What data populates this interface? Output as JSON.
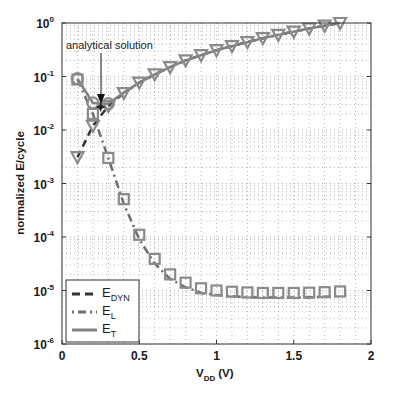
{
  "chart_data": {
    "type": "line",
    "title": "",
    "xlabel": "V_DD (V)",
    "xlabel_main": "V",
    "xlabel_sub": "DD",
    "xlabel_unit": "(V)",
    "ylabel": "normalized E/cycle",
    "xlim": [
      0,
      2
    ],
    "ylim": [
      1e-06,
      1
    ],
    "yscale": "log",
    "grid": true,
    "x_ticks": [
      "0",
      "0.5",
      "1",
      "1.5",
      "2"
    ],
    "x_tick_values": [
      0,
      0.5,
      1,
      1.5,
      2
    ],
    "y_ticks": [
      "10^0",
      "10^-1",
      "10^-2",
      "10^-3",
      "10^-4",
      "10^-5",
      "10^-6"
    ],
    "y_tick_exponents": [
      "0",
      "-1",
      "-2",
      "-3",
      "-4",
      "-5",
      "-6"
    ],
    "legend_position": "lower left",
    "x": [
      0.1,
      0.2,
      0.3,
      0.4,
      0.5,
      0.6,
      0.7,
      0.8,
      0.9,
      1.0,
      1.1,
      1.2,
      1.3,
      1.4,
      1.5,
      1.6,
      1.7,
      1.8
    ],
    "series": [
      {
        "name": "E_DYN",
        "label_main": "E",
        "label_sub": "DYN",
        "style": "dashed",
        "marker": "triangle-down",
        "values": [
          0.0031,
          0.012,
          0.028,
          0.049,
          0.077,
          0.11,
          0.15,
          0.2,
          0.25,
          0.31,
          0.37,
          0.44,
          0.52,
          0.6,
          0.69,
          0.79,
          0.89,
          1.0
        ]
      },
      {
        "name": "E_L",
        "label_main": "E",
        "label_sub": "L",
        "style": "dash-dot",
        "marker": "square",
        "values": [
          0.088,
          0.02,
          0.003,
          0.00051,
          0.00011,
          3.9e-05,
          2e-05,
          1.4e-05,
          1.1e-05,
          1e-05,
          9.5e-06,
          9.2e-06,
          9e-06,
          9e-06,
          9e-06,
          9.1e-06,
          9.3e-06,
          9.6e-06
        ]
      },
      {
        "name": "E_T",
        "label_main": "E",
        "label_sub": "T",
        "style": "solid",
        "marker": "circle",
        "values": [
          0.091,
          0.032,
          0.031,
          0.05,
          0.077,
          0.11,
          0.15,
          0.2,
          0.25,
          0.31,
          0.37,
          0.44,
          0.52,
          0.6,
          0.69,
          0.79,
          0.89,
          1.0
        ]
      }
    ],
    "annotations": [
      {
        "text": "analytical solution",
        "x": 0.25,
        "y": 0.027,
        "arrow": true
      }
    ]
  },
  "colors": {
    "axis": "#333333",
    "grid": "#9a9a9a",
    "dyn_line": "#333333",
    "leak_line": "#6e6e6e",
    "total_line": "#808080",
    "marker": "#8a8a8a"
  }
}
